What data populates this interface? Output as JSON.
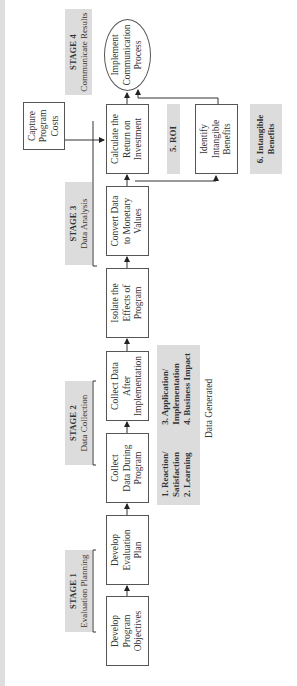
{
  "diagram": {
    "orientation": "rotated-90-ccw",
    "stages": [
      {
        "number": "STAGE 1",
        "name": "Evaluation Planning"
      },
      {
        "number": "STAGE 2",
        "name": "Data Collection"
      },
      {
        "number": "STAGE 3",
        "name": "Data Analysis"
      },
      {
        "number": "STAGE 4",
        "name": "Communicate Results"
      }
    ],
    "steps": [
      {
        "label": "Develop\nProgram\nObjectives"
      },
      {
        "label": "Develop\nEvaluation\nPlan"
      },
      {
        "label": "Collect\nData During\nProgram"
      },
      {
        "label": "Collect Data\nAfter\nImplementation"
      },
      {
        "label": "Isolate the\nEffects of\nProgram"
      },
      {
        "label": "Convert Data\nto Monetary\nValues"
      },
      {
        "label": "Calculate the\nReturn on\nInvestment"
      },
      {
        "label": "Implement\nCommunication\nProcess"
      }
    ],
    "side_steps": {
      "capture_costs": "Capture\nProgram\nCosts",
      "intangible": "Identify\nIntangible\nBenefits"
    },
    "data_generated": {
      "col1": "1. Reaction/\n    Satisfaction\n2. Learning",
      "col2": "3. Application/\n    Implementation\n4. Business Impact",
      "caption": "Data Generated"
    },
    "roi_label": "5. ROI",
    "intangible_label": "6. Intangible\nBenefits",
    "colors": {
      "shade": "#dcdcdc",
      "border": "#555555",
      "text": "#333333"
    }
  }
}
